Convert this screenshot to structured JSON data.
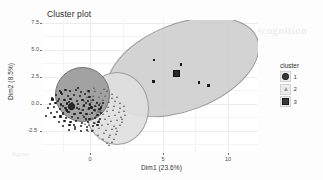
{
  "chart_data": {
    "type": "scatter",
    "title": "Cluster plot",
    "xlabel": "Dim1 (23.6%)",
    "ylabel": "Dim2 (8.5%)",
    "xlim": [
      -3.2,
      12.6
    ],
    "ylim": [
      -3.9,
      8.2
    ],
    "xticks": [
      0,
      5,
      10
    ],
    "xtick_labels": [
      "0",
      "5",
      "10"
    ],
    "yticks": [
      -2.5,
      0.0,
      2.5,
      5.0,
      7.5
    ],
    "ytick_labels": [
      "-2.5",
      "0.0",
      "2.5",
      "5.0",
      "7.5"
    ],
    "grid": true,
    "legend": {
      "title": "cluster",
      "position": "right",
      "entries": [
        {
          "label": "1",
          "shape": "circle",
          "color": "#3a3a3a"
        },
        {
          "label": "2",
          "shape": "triangle",
          "color": "#9a9a9a"
        },
        {
          "label": "3",
          "shape": "square",
          "color": "#3a3a3a"
        }
      ]
    },
    "series": [
      {
        "name": "1",
        "shape": "circle",
        "color": "#1d1d1d",
        "ellipse": {
          "cx": -1.05,
          "cy": 0.35,
          "rx": 1.95,
          "ry": 1.95,
          "angle": 0,
          "fill": "#9e9e9e"
        },
        "centroid": [
          -1.15,
          0.3
        ],
        "points": [
          [
            -1.95,
            1.72
          ],
          [
            -1.55,
            1.8
          ],
          [
            -1.2,
            1.66
          ],
          [
            -0.78,
            1.75
          ],
          [
            -0.4,
            1.58
          ],
          [
            -2.25,
            1.3
          ],
          [
            -1.8,
            1.38
          ],
          [
            -1.35,
            1.2
          ],
          [
            -0.92,
            1.34
          ],
          [
            -0.48,
            1.22
          ],
          [
            -0.1,
            1.4
          ],
          [
            0.22,
            1.12
          ],
          [
            -2.5,
            0.92
          ],
          [
            -2.05,
            0.98
          ],
          [
            -1.62,
            0.86
          ],
          [
            -1.18,
            0.95
          ],
          [
            -0.72,
            0.8
          ],
          [
            -0.3,
            0.9
          ],
          [
            0.1,
            0.74
          ],
          [
            0.48,
            0.86
          ],
          [
            -2.7,
            0.52
          ],
          [
            -2.28,
            0.6
          ],
          [
            -1.88,
            0.45
          ],
          [
            -1.45,
            0.55
          ],
          [
            -1.02,
            0.4
          ],
          [
            -0.6,
            0.5
          ],
          [
            -0.18,
            0.36
          ],
          [
            0.25,
            0.46
          ],
          [
            0.62,
            0.32
          ],
          [
            0.92,
            0.44
          ],
          [
            -2.85,
            0.12
          ],
          [
            -2.4,
            0.2
          ],
          [
            -1.98,
            0.05
          ],
          [
            -1.55,
            0.16
          ],
          [
            -1.12,
            0.02
          ],
          [
            -0.68,
            0.12
          ],
          [
            -0.25,
            -0.02
          ],
          [
            0.18,
            0.08
          ],
          [
            0.58,
            -0.05
          ],
          [
            0.95,
            0.05
          ],
          [
            -2.62,
            -0.3
          ],
          [
            -2.18,
            -0.22
          ],
          [
            -1.75,
            -0.36
          ],
          [
            -1.32,
            -0.26
          ],
          [
            -0.88,
            -0.4
          ],
          [
            -0.45,
            -0.3
          ],
          [
            0.0,
            -0.44
          ],
          [
            0.42,
            -0.34
          ],
          [
            0.8,
            -0.48
          ],
          [
            1.08,
            -0.36
          ],
          [
            -2.35,
            -0.72
          ],
          [
            -1.92,
            -0.64
          ],
          [
            -1.5,
            -0.78
          ],
          [
            -1.06,
            -0.68
          ],
          [
            -0.62,
            -0.82
          ],
          [
            -0.2,
            -0.72
          ],
          [
            0.22,
            -0.86
          ],
          [
            0.64,
            -0.76
          ],
          [
            1.0,
            -0.9
          ],
          [
            -2.05,
            -1.12
          ],
          [
            -1.62,
            -1.04
          ],
          [
            -1.18,
            -1.18
          ],
          [
            -0.75,
            -1.08
          ],
          [
            -0.32,
            -1.22
          ],
          [
            0.1,
            -1.12
          ],
          [
            0.52,
            -1.26
          ],
          [
            0.88,
            -1.16
          ],
          [
            -1.7,
            -1.52
          ],
          [
            -1.25,
            -1.44
          ],
          [
            -0.82,
            -1.58
          ],
          [
            -0.38,
            -1.48
          ],
          [
            0.05,
            -1.62
          ],
          [
            0.45,
            -1.52
          ],
          [
            0.8,
            -1.42
          ],
          [
            -1.3,
            -1.9
          ],
          [
            -0.85,
            -1.82
          ],
          [
            -0.42,
            -1.94
          ],
          [
            0.02,
            -1.86
          ],
          [
            0.4,
            -1.96
          ],
          [
            -2.52,
            1.08
          ],
          [
            -2.12,
            0.76
          ],
          [
            -1.72,
            0.28
          ],
          [
            -1.42,
            -0.1
          ],
          [
            -1.08,
            0.62
          ],
          [
            -0.55,
            0.06
          ],
          [
            -0.05,
            0.58
          ],
          [
            0.36,
            0.18
          ],
          [
            0.74,
            0.62
          ],
          [
            1.05,
            0.18
          ],
          [
            -1.88,
            1.56
          ],
          [
            -0.62,
            1.94
          ],
          [
            0.15,
            1.66
          ],
          [
            -2.95,
            -0.62
          ],
          [
            1.18,
            0.62
          ],
          [
            -1.52,
            -0.02
          ],
          [
            -1.72,
            -0.45
          ],
          [
            -1.26,
            0.72
          ],
          [
            -0.95,
            -1.46
          ],
          [
            -0.05,
            -0.9
          ]
        ]
      },
      {
        "name": "2",
        "shape": "triangle",
        "color": "#5d5d5d",
        "ellipse": {
          "cx": 1.15,
          "cy": -0.3,
          "rx": 2.3,
          "ry": 2.62,
          "angle": 0,
          "fill": "#e0e0e0"
        },
        "centroid": [
          0.95,
          -0.1
        ],
        "points": [
          [
            0.25,
            1.52
          ],
          [
            0.68,
            1.68
          ],
          [
            1.12,
            1.44
          ],
          [
            1.55,
            1.6
          ],
          [
            1.95,
            1.32
          ],
          [
            0.05,
            1.12
          ],
          [
            0.52,
            1.22
          ],
          [
            0.98,
            1.05
          ],
          [
            1.42,
            1.18
          ],
          [
            1.88,
            0.98
          ],
          [
            2.28,
            1.12
          ],
          [
            -0.12,
            0.72
          ],
          [
            0.35,
            0.84
          ],
          [
            0.82,
            0.66
          ],
          [
            1.28,
            0.78
          ],
          [
            1.72,
            0.6
          ],
          [
            2.15,
            0.72
          ],
          [
            2.52,
            0.55
          ],
          [
            -0.22,
            0.3
          ],
          [
            0.26,
            0.42
          ],
          [
            0.72,
            0.24
          ],
          [
            1.18,
            0.36
          ],
          [
            1.62,
            0.18
          ],
          [
            2.08,
            0.3
          ],
          [
            2.48,
            0.12
          ],
          [
            2.82,
            0.26
          ],
          [
            -0.3,
            -0.12
          ],
          [
            0.18,
            0.0
          ],
          [
            0.65,
            -0.18
          ],
          [
            1.1,
            -0.06
          ],
          [
            1.56,
            -0.24
          ],
          [
            2.02,
            -0.12
          ],
          [
            2.45,
            -0.3
          ],
          [
            2.8,
            -0.18
          ],
          [
            -0.18,
            -0.56
          ],
          [
            0.3,
            -0.44
          ],
          [
            0.76,
            -0.62
          ],
          [
            1.22,
            -0.5
          ],
          [
            1.68,
            -0.68
          ],
          [
            2.12,
            -0.56
          ],
          [
            2.55,
            -0.74
          ],
          [
            2.85,
            -0.6
          ],
          [
            0.02,
            -1.0
          ],
          [
            0.48,
            -0.88
          ],
          [
            0.94,
            -1.06
          ],
          [
            1.4,
            -0.94
          ],
          [
            1.85,
            -1.12
          ],
          [
            2.3,
            -1.0
          ],
          [
            2.68,
            -1.18
          ],
          [
            0.22,
            -1.46
          ],
          [
            0.7,
            -1.34
          ],
          [
            1.16,
            -1.52
          ],
          [
            1.62,
            -1.4
          ],
          [
            2.05,
            -1.58
          ],
          [
            2.48,
            -1.46
          ],
          [
            0.52,
            -1.92
          ],
          [
            0.98,
            -1.8
          ],
          [
            1.45,
            -1.98
          ],
          [
            1.9,
            -1.86
          ],
          [
            2.3,
            -2.02
          ],
          [
            0.88,
            -2.36
          ],
          [
            1.34,
            -2.24
          ],
          [
            1.8,
            -2.42
          ],
          [
            2.18,
            -2.3
          ],
          [
            1.25,
            -2.75
          ],
          [
            1.7,
            -2.62
          ],
          [
            2.05,
            -2.8
          ],
          [
            1.52,
            -3.1
          ],
          [
            1.95,
            -3.02
          ],
          [
            1.7,
            -3.35
          ],
          [
            0.62,
            1.92
          ],
          [
            1.35,
            1.86
          ],
          [
            2.62,
            -0.95
          ],
          [
            -0.05,
            -1.42
          ],
          [
            0.4,
            0.62
          ],
          [
            1.05,
            0.55
          ],
          [
            2.2,
            -1.75
          ],
          [
            0.15,
            -2.05
          ]
        ]
      },
      {
        "name": "3",
        "shape": "square",
        "color": "#1a1a1a",
        "ellipse": {
          "cx": 6.1,
          "cy": 3.45,
          "rx": 6.05,
          "ry": 2.25,
          "angle": -21,
          "fill": "#cfcfcf"
        },
        "centroid": [
          6.55,
          3.35
        ],
        "points": [
          [
            4.95,
            4.55
          ],
          [
            6.95,
            4.1
          ],
          [
            4.9,
            2.55
          ],
          [
            8.25,
            2.45
          ],
          [
            8.95,
            2.22
          ]
        ]
      }
    ]
  }
}
